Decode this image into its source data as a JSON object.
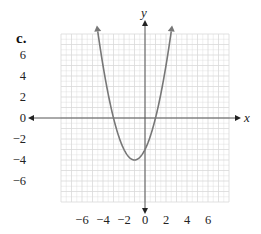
{
  "part_label": "c.",
  "chart_data": {
    "type": "line",
    "title": "",
    "function": "y = x^2 + 2x - 3",
    "xlabel": "x",
    "ylabel": "y",
    "xlim": [
      -8,
      8
    ],
    "ylim": [
      -8,
      8
    ],
    "grid": true,
    "x_ticks": [
      -6,
      -4,
      -2,
      0,
      2,
      4,
      6
    ],
    "y_ticks": [
      6,
      4,
      2,
      0,
      -2,
      -4,
      -6
    ],
    "x_tick_labels": [
      "−6",
      "−4",
      "−2",
      "0",
      "2",
      "4",
      "6"
    ],
    "y_tick_labels": [
      "6",
      "4",
      "2",
      "0",
      "−2",
      "−4",
      "−6"
    ],
    "series": [
      {
        "name": "parabola",
        "vertex": [
          -1,
          -4
        ],
        "x_intercepts": [
          -3,
          1
        ],
        "y_intercept": -3,
        "x": [
          -4.5,
          -4,
          -3,
          -2,
          -1,
          0,
          1,
          2,
          2.5
        ],
        "values": [
          8.25,
          5,
          0,
          -3,
          -4,
          -3,
          0,
          5,
          8.25
        ],
        "arrows_at_ends": true
      }
    ],
    "colors": {
      "grid": "#d9d9d9",
      "axis": "#555555",
      "curve": "#777777",
      "text": "#222222"
    }
  }
}
